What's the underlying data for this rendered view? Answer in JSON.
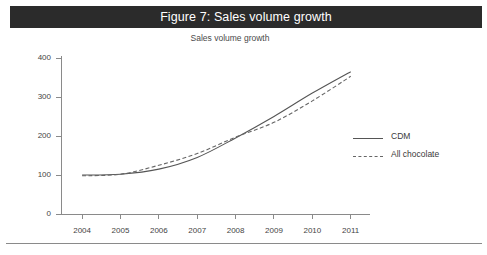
{
  "figure": {
    "caption": "Figure 7: Sales volume growth",
    "caption_bar_color": "#2b2b2b",
    "caption_text_color": "#ffffff"
  },
  "chart_data": {
    "type": "line",
    "title": "Sales volume growth",
    "xlabel": "",
    "ylabel": "",
    "categories": [
      "2004",
      "2005",
      "2006",
      "2007",
      "2008",
      "2009",
      "2010",
      "2011"
    ],
    "x": [
      2004,
      2005,
      2006,
      2007,
      2008,
      2009,
      2010,
      2011
    ],
    "ylim": [
      0,
      400
    ],
    "yticks": [
      0,
      100,
      200,
      300,
      400
    ],
    "ytick_labels": [
      "0",
      "100",
      "200",
      "300",
      "400"
    ],
    "grid": false,
    "legend_position": "right",
    "series": [
      {
        "name": "CDM",
        "style": "solid",
        "color": "#555555",
        "values": [
          100,
          102,
          115,
          145,
          195,
          250,
          310,
          365
        ]
      },
      {
        "name": "All chocolate",
        "style": "dashed",
        "color": "#666666",
        "values": [
          98,
          102,
          125,
          155,
          197,
          235,
          290,
          353
        ]
      }
    ]
  },
  "legend": {
    "items": [
      {
        "label": "CDM"
      },
      {
        "label": "All chocolate"
      }
    ]
  },
  "axis_colors": {
    "axis_line": "#8a8a8a",
    "tick_text": "#444444"
  }
}
